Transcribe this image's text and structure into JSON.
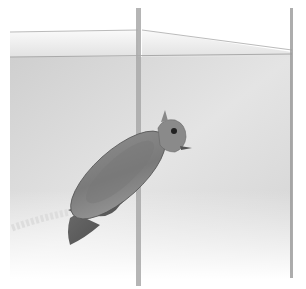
{
  "scene": {
    "description": "Pencil drawing of a bird clinging to a vertical pole against a paneled wall",
    "medium": "graphite pencil on white paper",
    "colors": {
      "paper": "#ffffff",
      "wall_light": "#e9e9e9",
      "wall_mid": "#d6d6d6",
      "wall_dark": "#bdbdbd",
      "pole": "#a8a8a8",
      "bird_body": "#6e6e6e",
      "bird_wing": "#8a8a8a",
      "bird_dark": "#4a4a4a",
      "eye": "#222222"
    }
  }
}
